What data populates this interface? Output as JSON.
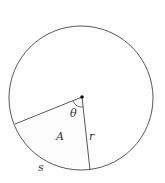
{
  "diagram": {
    "labels": {
      "angle": "θ",
      "area": "A",
      "radius": "r",
      "arc": "s"
    },
    "colors": {
      "stroke": "#444444",
      "center_dot": "#111111",
      "sector_fill": "#fdfdfd"
    }
  }
}
